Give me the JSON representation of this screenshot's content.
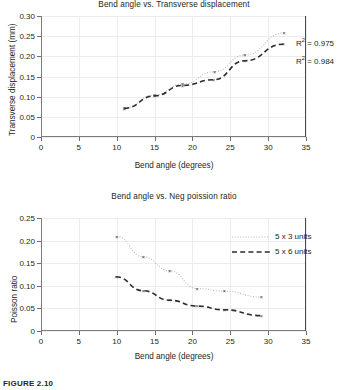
{
  "figure": {
    "caption": "FIGURE 2.10"
  },
  "charts": [
    {
      "id": "chart-transverse-displacement",
      "type": "scatter",
      "title": "Bend angle vs. Transverse displacement",
      "xlabel": "Bend angle (degrees)",
      "ylabel": "Transverse displacement (mm)",
      "xlim": [
        0,
        35
      ],
      "ylim": [
        0,
        0.3
      ],
      "xticks": [
        0,
        5,
        10,
        15,
        20,
        25,
        30,
        35
      ],
      "xticklabels": [
        "0",
        "5",
        "10",
        "15",
        "20",
        "25",
        "30",
        "35"
      ],
      "yticks": [
        0,
        0.05,
        0.1,
        0.15,
        0.2,
        0.25,
        0.3
      ],
      "yticklabels": [
        "0",
        "0.05",
        "0.10",
        "0.15",
        "0.20",
        "0.25",
        "0.30"
      ],
      "grid": true,
      "legend": null,
      "series": [
        {
          "name": "5 x 3 units",
          "style": "dotted",
          "color": "#b9b9b9",
          "marker": "x",
          "x": [
            11.0,
            15.0,
            18.7,
            22.9,
            26.9,
            32.1
          ],
          "y": [
            0.073,
            0.104,
            0.131,
            0.162,
            0.203,
            0.258
          ],
          "annotation": "R2 = 0.975",
          "r_squared": 0.975
        },
        {
          "name": "5 x 6 units",
          "style": "dashed",
          "color": "#2b2b2b",
          "marker": "x",
          "x": [
            11.0,
            15.0,
            18.7,
            22.8,
            26.9,
            32.0
          ],
          "y": [
            0.071,
            0.102,
            0.128,
            0.142,
            0.189,
            0.23
          ],
          "annotation": "R2 = 0.984",
          "r_squared": 0.984
        }
      ],
      "annotations": [
        {
          "text": "R",
          "sup": "2",
          "rest": " = 0.975"
        },
        {
          "text": "R",
          "sup": "2",
          "rest": " = 0.984"
        }
      ]
    },
    {
      "id": "chart-neg-poisson-ratio",
      "type": "scatter",
      "title": "Bend angle vs. Neg poission ratio",
      "xlabel": "Bend angle (degrees)",
      "ylabel": "Poisson ratio",
      "xlim": [
        0,
        35
      ],
      "ylim": [
        0,
        0.25
      ],
      "xticks": [
        0,
        5,
        10,
        15,
        20,
        25,
        30,
        35
      ],
      "xticklabels": [
        "0",
        "5",
        "10",
        "15",
        "20",
        "25",
        "30",
        "35"
      ],
      "yticks": [
        0,
        0.05,
        0.1,
        0.15,
        0.2,
        0.25
      ],
      "yticklabels": [
        "0",
        "0.05",
        "0.10",
        "0.15",
        "0.20",
        "0.25"
      ],
      "grid": true,
      "legend": {
        "position": "top-right",
        "entries": [
          {
            "label": "5 x 3 units",
            "style": "dotted"
          },
          {
            "label": "5 x 6 units",
            "style": "dashed"
          }
        ]
      },
      "series": [
        {
          "name": "5 x 3 units",
          "style": "dotted",
          "color": "#b9b9b9",
          "marker": "x",
          "x": [
            10.0,
            13.5,
            17.0,
            20.6,
            24.2,
            29.1
          ],
          "y": [
            0.209,
            0.164,
            0.133,
            0.094,
            0.088,
            0.075
          ]
        },
        {
          "name": "5 x 6 units",
          "style": "dashed",
          "color": "#2b2b2b",
          "marker": "x",
          "x": [
            9.9,
            13.5,
            17.0,
            20.6,
            24.2,
            29.1
          ],
          "y": [
            0.12,
            0.089,
            0.068,
            0.055,
            0.047,
            0.034
          ]
        }
      ]
    }
  ]
}
